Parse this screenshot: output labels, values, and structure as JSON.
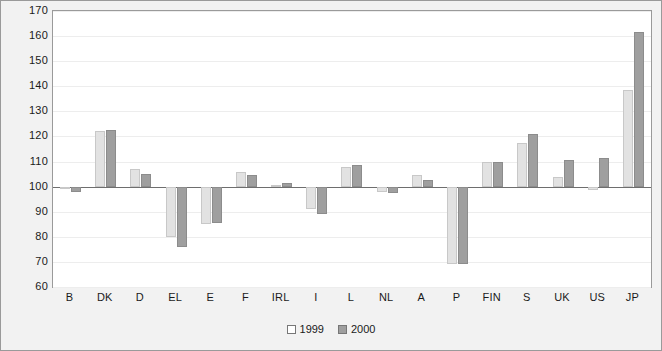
{
  "chart_data": {
    "type": "bar",
    "title": "",
    "subtitle": "",
    "xlabel": "",
    "ylabel": "",
    "ylim": [
      60,
      170
    ],
    "ytick_step": 10,
    "yticks": [
      170,
      160,
      150,
      140,
      130,
      120,
      110,
      100,
      90,
      80,
      70,
      60
    ],
    "grid": true,
    "baseline": 100,
    "legend_position": "bottom-center",
    "categories": [
      "B",
      "DK",
      "D",
      "EL",
      "E",
      "F",
      "IRL",
      "I",
      "L",
      "NL",
      "A",
      "P",
      "FIN",
      "S",
      "UK",
      "US",
      "JP"
    ],
    "series": [
      {
        "name": "1999",
        "color": "#e2e2e2",
        "values": [
          99,
          122,
          107,
          80,
          85,
          106,
          100.5,
          91,
          108,
          98,
          104.5,
          69,
          110,
          117.5,
          104,
          98.5,
          138.5
        ]
      },
      {
        "name": "2000",
        "color": "#9f9f9f",
        "values": [
          98,
          122.5,
          105,
          76,
          85.5,
          104.5,
          101.5,
          89,
          108.5,
          97.5,
          102.5,
          69,
          110,
          121,
          110.5,
          111.5,
          161.5
        ]
      }
    ]
  },
  "legend": {
    "entries": [
      {
        "label": "1999"
      },
      {
        "label": "2000"
      }
    ]
  },
  "colors": {
    "series_1999": "#e2e2e2",
    "series_2000": "#9f9f9f",
    "frame": "#9a9a9a",
    "background": "#f2f2f2",
    "plot_background": "#ffffff",
    "baseline": "#6e6e6e"
  }
}
